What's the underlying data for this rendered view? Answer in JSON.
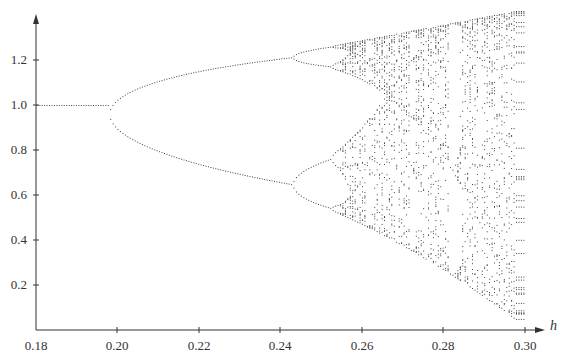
{
  "chart_data": {
    "type": "scatter",
    "title": "",
    "subtitle": "",
    "xlabel": "h",
    "ylabel": "",
    "xlim": [
      0.18,
      0.3
    ],
    "ylim": [
      0,
      1.35
    ],
    "grid": false,
    "legend": null,
    "x_ticks": [
      "0.18",
      "0.20",
      "0.22",
      "0.24",
      "0.26",
      "0.28",
      "0.30"
    ],
    "y_ticks": [
      "0.2",
      "0.4",
      "0.6",
      "0.8",
      "1.0",
      "1.2"
    ],
    "series": [
      {
        "name": "period-1 fixed point",
        "h_range": [
          0.18,
          0.198
        ],
        "values": [
          1.0
        ]
      },
      {
        "name": "period-2 branches",
        "h_range": [
          0.198,
          0.243
        ],
        "values_at_0.243": [
          1.22,
          0.66
        ]
      },
      {
        "name": "period-4 branches",
        "h_range": [
          0.243,
          0.252
        ],
        "values_at_0.252": [
          1.26,
          1.17,
          0.74,
          0.49
        ]
      },
      {
        "name": "chaotic band",
        "h_range": [
          0.252,
          0.3
        ],
        "envelope_at_0.30": [
          0.05,
          1.35
        ]
      }
    ],
    "bifurcation_points": [
      {
        "h": 0.198,
        "value": 1.0
      },
      {
        "h": 0.243,
        "value": 1.22
      },
      {
        "h": 0.243,
        "value": 0.66
      }
    ],
    "periodic_window": {
      "h_approx": 0.277,
      "note": "visible gap in chaotic band"
    }
  },
  "axes": {
    "x_label": "h",
    "x_tick_labels": [
      "0.18",
      "0.20",
      "0.22",
      "0.24",
      "0.26",
      "0.28",
      "0.30"
    ],
    "y_tick_labels": [
      "0.2",
      "0.4",
      "0.6",
      "0.8",
      "1.0",
      "1.2"
    ]
  },
  "style": {
    "axis_color": "#333333",
    "point_color": "#444444"
  }
}
